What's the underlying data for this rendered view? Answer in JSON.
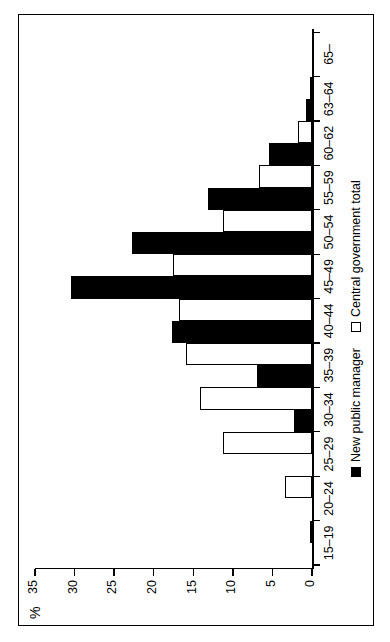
{
  "figure": {
    "percent_axis_label": "%",
    "orientation": "rotated-90-ccw"
  },
  "legend": {
    "position": "bottom-center",
    "entries": [
      {
        "label": "New public manager",
        "swatch": "filled-black-square",
        "color": "#000000"
      },
      {
        "label": "Central government total",
        "swatch": "open-white-square",
        "color": "#ffffff"
      }
    ]
  },
  "chart_data": {
    "type": "bar",
    "title": "",
    "subtitle": "",
    "xlabel": "",
    "ylabel": "%",
    "ylim": [
      0,
      35
    ],
    "yticks": [
      0,
      5,
      10,
      15,
      20,
      25,
      30,
      35
    ],
    "ytick_labels": [
      "0",
      "5",
      "10",
      "15",
      "20",
      "25",
      "30",
      "35"
    ],
    "grid": false,
    "legend_position": "bottom-center",
    "categories": [
      "15–19",
      "20–24",
      "25–29",
      "30–34",
      "35–39",
      "40–44",
      "45–49",
      "50–54",
      "55–59",
      "60–62",
      "63–64",
      "65–"
    ],
    "series": [
      {
        "name": "New public manager",
        "color": "#000000",
        "values": [
          0,
          0,
          0,
          2.3,
          6.9,
          17.7,
          30.4,
          22.8,
          13.2,
          5.4,
          0.8,
          0
        ]
      },
      {
        "name": "Central government total",
        "color": "#ffffff",
        "values": [
          0.3,
          3.4,
          11.3,
          14.1,
          15.9,
          16.8,
          17.6,
          11.3,
          6.7,
          1.8,
          0.3,
          0
        ]
      }
    ]
  }
}
